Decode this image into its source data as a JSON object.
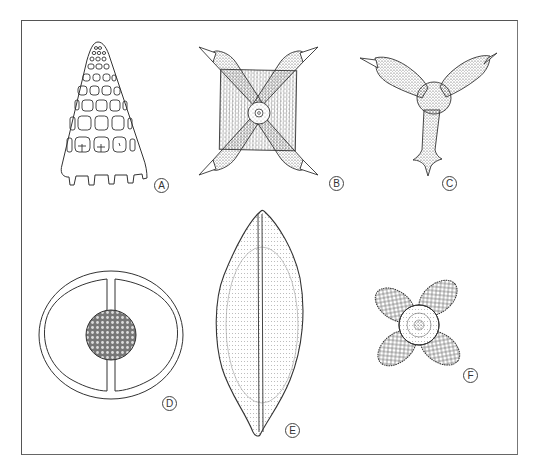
{
  "figure": {
    "type": "scientific-line-illustration",
    "colors": {
      "ink": "#333333",
      "stipple": "#555555",
      "border": "#555555",
      "background": "#ffffff"
    },
    "panels": [
      {
        "id": "A",
        "label": "A",
        "description": "conical latticed shell with rows of rounded pores and toothed base"
      },
      {
        "id": "B",
        "label": "B",
        "description": "square stippled body with four spiny arms radiating diagonally and central ring"
      },
      {
        "id": "C",
        "label": "C",
        "description": "three-armed stippled form with spine-tipped arms and central body"
      },
      {
        "id": "D",
        "label": "D",
        "description": "oval double-walled ring divided by central bar holding a spherical reticulate body"
      },
      {
        "id": "E",
        "label": "E",
        "description": "lens/spindle-shaped valve with central raphe line and dotted striae"
      },
      {
        "id": "F",
        "label": "F",
        "description": "four-lobed reticulate form with circular central area"
      }
    ]
  }
}
